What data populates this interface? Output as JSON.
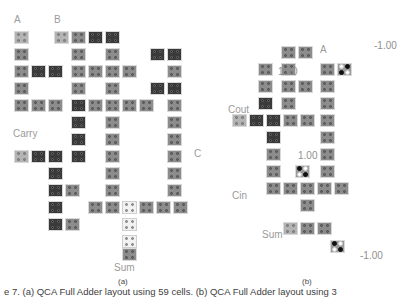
{
  "figure": {
    "caption": "e 7. (a) QCA Full Adder layout using 59 cells. (b) QCA Full Adder layout using 3",
    "subcaptions": {
      "a": "(a)",
      "b": "(b)"
    }
  },
  "panel_a": {
    "title_labels": [
      {
        "text": "A",
        "x": 14,
        "y": 14
      },
      {
        "text": "B",
        "x": 54,
        "y": 14
      },
      {
        "text": "Carry",
        "x": 13,
        "y": 128
      },
      {
        "text": "C",
        "x": 194,
        "y": 148
      },
      {
        "text": "Sum",
        "x": 114,
        "y": 262
      }
    ],
    "cells": [
      {
        "x": 14,
        "y": 31,
        "fill": "light"
      },
      {
        "x": 54,
        "y": 31,
        "fill": "light"
      },
      {
        "x": 71,
        "y": 31,
        "fill": "mid"
      },
      {
        "x": 88,
        "y": 31,
        "fill": "dark"
      },
      {
        "x": 105,
        "y": 31,
        "fill": "dark"
      },
      {
        "x": 14,
        "y": 48,
        "fill": "mid"
      },
      {
        "x": 71,
        "y": 48,
        "fill": "mid"
      },
      {
        "x": 105,
        "y": 48,
        "fill": "mid"
      },
      {
        "x": 150,
        "y": 48,
        "fill": "dark"
      },
      {
        "x": 167,
        "y": 48,
        "fill": "dark"
      },
      {
        "x": 14,
        "y": 65,
        "fill": "mid"
      },
      {
        "x": 31,
        "y": 65,
        "fill": "dark"
      },
      {
        "x": 48,
        "y": 65,
        "fill": "dark"
      },
      {
        "x": 71,
        "y": 65,
        "fill": "mid"
      },
      {
        "x": 88,
        "y": 65,
        "fill": "mid"
      },
      {
        "x": 105,
        "y": 65,
        "fill": "mid"
      },
      {
        "x": 122,
        "y": 65,
        "fill": "mid"
      },
      {
        "x": 167,
        "y": 65,
        "fill": "mid"
      },
      {
        "x": 14,
        "y": 82,
        "fill": "mid"
      },
      {
        "x": 71,
        "y": 82,
        "fill": "mid"
      },
      {
        "x": 105,
        "y": 82,
        "fill": "mid"
      },
      {
        "x": 150,
        "y": 82,
        "fill": "dark"
      },
      {
        "x": 167,
        "y": 82,
        "fill": "dark"
      },
      {
        "x": 14,
        "y": 99,
        "fill": "mid"
      },
      {
        "x": 31,
        "y": 99,
        "fill": "mid"
      },
      {
        "x": 48,
        "y": 99,
        "fill": "mid"
      },
      {
        "x": 71,
        "y": 99,
        "fill": "dark"
      },
      {
        "x": 88,
        "y": 99,
        "fill": "mid"
      },
      {
        "x": 105,
        "y": 99,
        "fill": "mid"
      },
      {
        "x": 122,
        "y": 99,
        "fill": "mid"
      },
      {
        "x": 139,
        "y": 99,
        "fill": "mid"
      },
      {
        "x": 167,
        "y": 99,
        "fill": "mid"
      },
      {
        "x": 71,
        "y": 116,
        "fill": "dark"
      },
      {
        "x": 105,
        "y": 116,
        "fill": "mid"
      },
      {
        "x": 167,
        "y": 116,
        "fill": "mid"
      },
      {
        "x": 71,
        "y": 133,
        "fill": "dark"
      },
      {
        "x": 105,
        "y": 133,
        "fill": "mid"
      },
      {
        "x": 167,
        "y": 133,
        "fill": "mid"
      },
      {
        "x": 14,
        "y": 150,
        "fill": "light"
      },
      {
        "x": 31,
        "y": 150,
        "fill": "dark"
      },
      {
        "x": 48,
        "y": 150,
        "fill": "dark"
      },
      {
        "x": 71,
        "y": 150,
        "fill": "dark"
      },
      {
        "x": 105,
        "y": 150,
        "fill": "mid"
      },
      {
        "x": 167,
        "y": 150,
        "fill": "mid"
      },
      {
        "x": 48,
        "y": 167,
        "fill": "dark"
      },
      {
        "x": 105,
        "y": 167,
        "fill": "mid"
      },
      {
        "x": 167,
        "y": 167,
        "fill": "mid"
      },
      {
        "x": 48,
        "y": 184,
        "fill": "dark"
      },
      {
        "x": 65,
        "y": 184,
        "fill": "mid"
      },
      {
        "x": 105,
        "y": 184,
        "fill": "mid"
      },
      {
        "x": 167,
        "y": 184,
        "fill": "mid"
      },
      {
        "x": 48,
        "y": 201,
        "fill": "dark"
      },
      {
        "x": 88,
        "y": 201,
        "fill": "mid"
      },
      {
        "x": 105,
        "y": 201,
        "fill": "mid"
      },
      {
        "x": 122,
        "y": 201,
        "fill": "white"
      },
      {
        "x": 139,
        "y": 201,
        "fill": "mid"
      },
      {
        "x": 156,
        "y": 201,
        "fill": "mid"
      },
      {
        "x": 173,
        "y": 201,
        "fill": "mid"
      },
      {
        "x": 48,
        "y": 218,
        "fill": "dark"
      },
      {
        "x": 65,
        "y": 218,
        "fill": "mid"
      },
      {
        "x": 122,
        "y": 218,
        "fill": "white"
      },
      {
        "x": 122,
        "y": 235,
        "fill": "white"
      },
      {
        "x": 122,
        "y": 248,
        "fill": "mid"
      }
    ]
  },
  "panel_b": {
    "title_labels": [
      {
        "text": "A",
        "x": 320,
        "y": 44
      },
      {
        "text": "Cout",
        "x": 228,
        "y": 104
      },
      {
        "text": "Cin",
        "x": 232,
        "y": 190
      },
      {
        "text": "Sum",
        "x": 262,
        "y": 229
      }
    ],
    "value_labels": [
      {
        "text": "1.00",
        "x": 278,
        "y": 66
      },
      {
        "text": "-1.00",
        "x": 374,
        "y": 40
      },
      {
        "text": "1.00",
        "x": 298,
        "y": 150
      },
      {
        "text": "-1.00",
        "x": 360,
        "y": 250
      }
    ],
    "cells": [
      {
        "x": 281,
        "y": 46,
        "fill": "mid"
      },
      {
        "x": 298,
        "y": 46,
        "fill": "mid"
      },
      {
        "x": 258,
        "y": 63,
        "fill": "mid"
      },
      {
        "x": 281,
        "y": 63,
        "fill": "mid"
      },
      {
        "x": 320,
        "y": 63,
        "fill": "mid"
      },
      {
        "x": 337,
        "y": 63,
        "fill": "pol",
        "pol": "antidiag"
      },
      {
        "x": 258,
        "y": 80,
        "fill": "mid"
      },
      {
        "x": 281,
        "y": 80,
        "fill": "mid"
      },
      {
        "x": 298,
        "y": 80,
        "fill": "mid"
      },
      {
        "x": 320,
        "y": 80,
        "fill": "mid"
      },
      {
        "x": 258,
        "y": 97,
        "fill": "dark"
      },
      {
        "x": 281,
        "y": 97,
        "fill": "mid"
      },
      {
        "x": 320,
        "y": 97,
        "fill": "mid"
      },
      {
        "x": 232,
        "y": 114,
        "fill": "light"
      },
      {
        "x": 249,
        "y": 114,
        "fill": "dark"
      },
      {
        "x": 266,
        "y": 114,
        "fill": "dark"
      },
      {
        "x": 283,
        "y": 114,
        "fill": "mid"
      },
      {
        "x": 300,
        "y": 114,
        "fill": "mid"
      },
      {
        "x": 320,
        "y": 114,
        "fill": "mid"
      },
      {
        "x": 266,
        "y": 131,
        "fill": "dark"
      },
      {
        "x": 320,
        "y": 131,
        "fill": "mid"
      },
      {
        "x": 266,
        "y": 148,
        "fill": "mid"
      },
      {
        "x": 320,
        "y": 148,
        "fill": "mid"
      },
      {
        "x": 266,
        "y": 165,
        "fill": "mid"
      },
      {
        "x": 295,
        "y": 165,
        "fill": "pol",
        "pol": "diag"
      },
      {
        "x": 320,
        "y": 165,
        "fill": "mid"
      },
      {
        "x": 266,
        "y": 182,
        "fill": "mid"
      },
      {
        "x": 283,
        "y": 182,
        "fill": "mid"
      },
      {
        "x": 300,
        "y": 182,
        "fill": "mid"
      },
      {
        "x": 317,
        "y": 182,
        "fill": "mid"
      },
      {
        "x": 334,
        "y": 182,
        "fill": "mid"
      },
      {
        "x": 300,
        "y": 199,
        "fill": "mid"
      },
      {
        "x": 283,
        "y": 222,
        "fill": "light"
      },
      {
        "x": 300,
        "y": 222,
        "fill": "mid"
      },
      {
        "x": 317,
        "y": 222,
        "fill": "mid"
      },
      {
        "x": 330,
        "y": 240,
        "fill": "pol",
        "pol": "diag"
      }
    ]
  }
}
